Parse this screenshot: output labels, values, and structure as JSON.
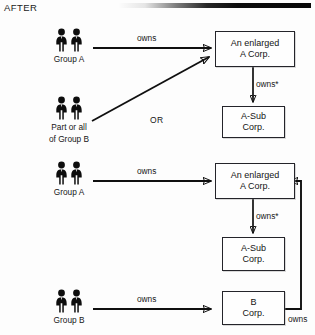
{
  "header": {
    "section_label": "AFTER",
    "rule": "top-divider-rule"
  },
  "diagram": {
    "type": "corporate-ownership-structure",
    "scenarios": [
      {
        "id": "scenario-1",
        "actors": [
          {
            "id": "group-a-top",
            "icon": "two-people-icon",
            "label": "Group A"
          },
          {
            "id": "part-or-all-group-b",
            "icon": "two-people-icon",
            "label_line1": "Part or all",
            "label_line2": "of Group B"
          }
        ],
        "alternative_label": "OR",
        "entities": [
          {
            "id": "enlarged-a-corp-1",
            "line1": "An enlarged",
            "line2": "A Corp."
          },
          {
            "id": "a-sub-corp-1",
            "line1": "A-Sub",
            "line2": "Corp."
          }
        ],
        "edges": [
          {
            "id": "edge-group-a-owns-enlarged-a-1",
            "label": "owns",
            "from": "group-a-top",
            "to": "enlarged-a-corp-1"
          },
          {
            "id": "edge-group-b-part-to-enlarged-a-1",
            "label": "",
            "from": "part-or-all-group-b",
            "to": "enlarged-a-corp-1"
          },
          {
            "id": "edge-enlarged-a-owns-a-sub-1",
            "label": "owns*",
            "from": "enlarged-a-corp-1",
            "to": "a-sub-corp-1"
          }
        ]
      },
      {
        "id": "scenario-2",
        "actors": [
          {
            "id": "group-a-bottom",
            "icon": "two-people-icon",
            "label": "Group A"
          },
          {
            "id": "group-b-bottom",
            "icon": "two-people-icon",
            "label": "Group B"
          }
        ],
        "entities": [
          {
            "id": "enlarged-a-corp-2",
            "line1": "An enlarged",
            "line2": "A Corp."
          },
          {
            "id": "a-sub-corp-2",
            "line1": "A-Sub",
            "line2": "Corp."
          },
          {
            "id": "b-corp",
            "line1": "B",
            "line2": "Corp."
          }
        ],
        "edges": [
          {
            "id": "edge-group-a-owns-enlarged-a-2",
            "label": "owns",
            "from": "group-a-bottom",
            "to": "enlarged-a-corp-2"
          },
          {
            "id": "edge-enlarged-a-owns-a-sub-2",
            "label": "owns*",
            "from": "enlarged-a-corp-2",
            "to": "a-sub-corp-2"
          },
          {
            "id": "edge-group-b-owns-b-corp",
            "label": "owns",
            "from": "group-b-bottom",
            "to": "b-corp"
          },
          {
            "id": "edge-b-corp-owns-enlarged-a-2",
            "label": "owns",
            "from": "b-corp",
            "to": "enlarged-a-corp-2"
          }
        ]
      }
    ]
  },
  "colors": {
    "ink": "#101010",
    "box_border": "#24242a",
    "page_background": "#fdfdfd"
  }
}
